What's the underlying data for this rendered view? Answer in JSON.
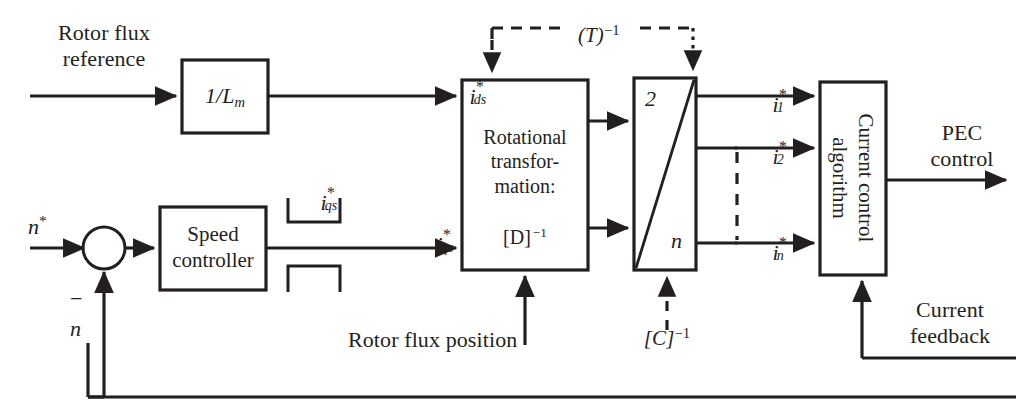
{
  "diagram": {
    "type": "control-block-diagram",
    "colors": {
      "stroke": "#231f20",
      "background": "#ffffff"
    }
  },
  "blocks": [
    {
      "id": "inv-lm",
      "label": "1/L",
      "label_sub": "m",
      "x": 182,
      "y": 60,
      "w": 86,
      "h": 73
    },
    {
      "id": "speed-ctrl",
      "label": "Speed\ncontroller",
      "x": 160,
      "y": 207,
      "w": 106,
      "h": 83
    },
    {
      "id": "rot-transf",
      "label": "Rotational\ntransfor-\nmation:",
      "x": 462,
      "y": 80,
      "w": 126,
      "h": 190
    },
    {
      "id": "converter",
      "label": "",
      "x": 634,
      "y": 78,
      "w": 62,
      "h": 192
    },
    {
      "id": "curr-ctrl",
      "label": "Current control\nalgorithm",
      "x": 820,
      "y": 82,
      "w": 66,
      "h": 193
    }
  ],
  "labels": {
    "rotor_flux_reference": "Rotor flux\nreference",
    "inv_lm_main": "1/L",
    "inv_lm_sub": "m",
    "speed_controller": "Speed\ncontroller",
    "rotational_transformation": "Rotational\ntransfor-\nmation:",
    "rotational_matrix": "[D]",
    "rotational_matrix_exp": "−1",
    "current_control_algorithm_line1": "Current control",
    "current_control_algorithm_line2": "algorithm",
    "pec_control": "PEC\ncontrol",
    "current_feedback": "Current\nfeedback",
    "rotor_flux_position": "Rotor flux position",
    "converter_top": "2",
    "converter_bottom": "n",
    "t_inverse_base": "(T)",
    "t_inverse_exp": "−1",
    "c_inverse_base": "[C]",
    "c_inverse_exp": "−1",
    "speed_reference": "n",
    "speed_reference_star": "*",
    "minus_sign": "−",
    "speed_feedback": "n"
  },
  "signals": [
    {
      "id": "ids-ref",
      "base": "i",
      "star": "*",
      "sub": "ds",
      "x": 455,
      "y": 62
    },
    {
      "id": "iqs-ref",
      "base": "i",
      "star": "*",
      "sub": "qs",
      "x": 422,
      "y": 210
    },
    {
      "id": "iqs-annot",
      "base": "i",
      "star": "*",
      "sub": "qs",
      "x": 300,
      "y": 168
    },
    {
      "id": "i1-ref",
      "base": "i",
      "star": "*",
      "sub": "1",
      "x": 752,
      "y": 70
    },
    {
      "id": "i2-ref",
      "base": "i",
      "star": "*",
      "sub": "2",
      "x": 752,
      "y": 123
    },
    {
      "id": "in-ref",
      "base": "i",
      "star": "*",
      "sub": "n",
      "x": 752,
      "y": 218
    }
  ],
  "annotations": {
    "dashed_transform_label": "(T)",
    "dashed_transform_exponent": "−1",
    "dashed_decoupling_label": "[C]",
    "dashed_decoupling_exponent": "−1"
  }
}
